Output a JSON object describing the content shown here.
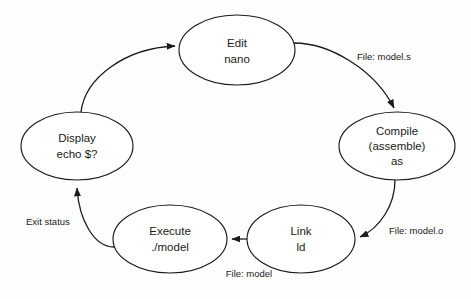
{
  "diagram": {
    "background_color": "#fefefe",
    "stroke_color": "#1a1a1a",
    "nodes": [
      {
        "id": "edit",
        "lines": [
          "Edit",
          "nano"
        ],
        "cx": 237,
        "cy": 50,
        "rx": 58,
        "ry": 35
      },
      {
        "id": "compile",
        "lines": [
          "Compile",
          "(assemble)",
          "as"
        ],
        "cx": 397,
        "cy": 146,
        "rx": 58,
        "ry": 34
      },
      {
        "id": "link",
        "lines": [
          "Link",
          "ld"
        ],
        "cx": 301,
        "cy": 239,
        "rx": 54,
        "ry": 34
      },
      {
        "id": "execute",
        "lines": [
          "Execute",
          "./model"
        ],
        "cx": 170,
        "cy": 239,
        "rx": 57,
        "ry": 34
      },
      {
        "id": "display",
        "lines": [
          "Display",
          "echo $?"
        ],
        "cx": 77,
        "cy": 146,
        "rx": 56,
        "ry": 34
      }
    ],
    "edges": [
      {
        "id": "edit-to-compile",
        "from": "edit",
        "to": "compile",
        "label": "File: model.s",
        "label_x": 357,
        "label_y": 57,
        "anchor": "start"
      },
      {
        "id": "compile-to-link",
        "from": "compile",
        "to": "link",
        "label": "File: model.o",
        "label_x": 389,
        "label_y": 231,
        "anchor": "start"
      },
      {
        "id": "link-to-execute",
        "from": "link",
        "to": "execute",
        "label": "File: model",
        "label_x": 249,
        "label_y": 274,
        "anchor": "middle"
      },
      {
        "id": "execute-to-display",
        "from": "execute",
        "to": "display",
        "label": "Exit status",
        "label_x": 26,
        "label_y": 222,
        "anchor": "start"
      },
      {
        "id": "display-to-edit",
        "from": "display",
        "to": "edit",
        "label": "",
        "label_x": 0,
        "label_y": 0,
        "anchor": "start"
      }
    ]
  }
}
